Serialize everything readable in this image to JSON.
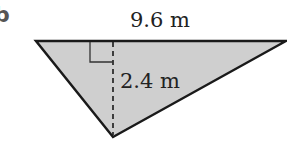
{
  "diagram": {
    "part_label": "b",
    "shape": "triangle",
    "base_label": "9.6 m",
    "height_label": "2.4 m",
    "fill_color": "#cfcfcf",
    "stroke_color": "#1a1a1a",
    "right_angle_marker": true
  }
}
